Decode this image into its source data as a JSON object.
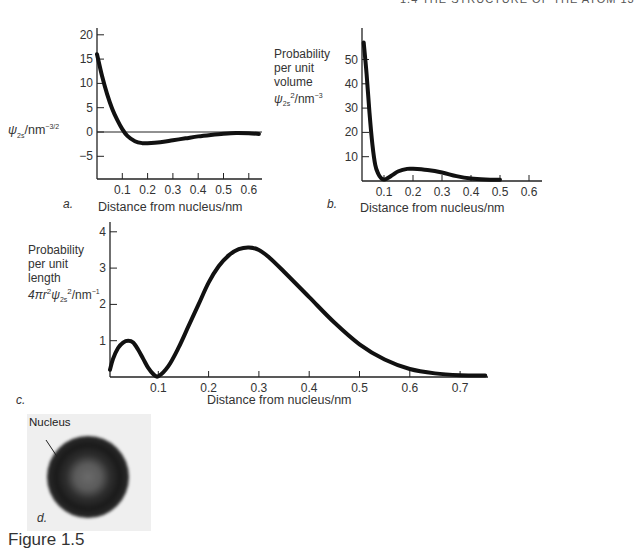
{
  "header": {
    "running_head": "1.4   THE STRUCTURE OF THE ATOM   13"
  },
  "caption": "Figure 1.5",
  "panels": {
    "a": {
      "letter": "a.",
      "ylabel_main": "ψ",
      "ylabel_sub": "2s",
      "ylabel_unit": "/nm",
      "ylabel_exp": "−3/2",
      "xlabel": "Distance from nucleus/nm",
      "yticks": [
        "20",
        "15",
        "10",
        "5",
        "0",
        "−5"
      ],
      "xticks": [
        "0.1",
        "0.2",
        "0.3",
        "0.4",
        "0.5",
        "0.6"
      ]
    },
    "b": {
      "letter": "b.",
      "ylabel_lines": [
        "Probability",
        "per unit",
        "volume"
      ],
      "ylabel_main": "ψ",
      "ylabel_sub": "2s",
      "ylabel_sup": "2",
      "ylabel_unit": "/nm",
      "ylabel_exp": "−3",
      "xlabel": "Distance from nucleus/nm",
      "yticks": [
        "50",
        "40",
        "30",
        "20",
        "10"
      ],
      "xticks": [
        "0.1",
        "0.2",
        "0.3",
        "0.4",
        "0.5",
        "0.6"
      ]
    },
    "c": {
      "letter": "c.",
      "ylabel_lines": [
        "Probability",
        "per unit",
        "length"
      ],
      "ylabel_prefix": "4πr",
      "ylabel_r_sup": "2",
      "ylabel_main": "ψ",
      "ylabel_sub": "2s",
      "ylabel_sup": "2",
      "ylabel_unit": "/nm",
      "ylabel_exp": "−1",
      "xlabel": "Distance from nucleus/nm",
      "yticks": [
        "4",
        "3",
        "2",
        "1"
      ],
      "xticks": [
        "0.1",
        "0.2",
        "0.3",
        "0.4",
        "0.5",
        "0.6",
        "0.7"
      ]
    },
    "d": {
      "letter": "d.",
      "annotation": "Nucleus"
    }
  },
  "chart_data": [
    {
      "id": "a",
      "type": "line",
      "title": "",
      "xlabel": "Distance from nucleus/nm",
      "ylabel": "ψ2s/nm^-3/2",
      "xlim": [
        0,
        0.65
      ],
      "ylim": [
        -9.5,
        22
      ],
      "xticks": [
        0.1,
        0.2,
        0.3,
        0.4,
        0.5,
        0.6
      ],
      "yticks": [
        -5,
        0,
        5,
        10,
        15,
        20
      ],
      "grid": false,
      "zero_line": true,
      "series": [
        {
          "name": "ψ2s",
          "x": [
            0.0,
            0.02,
            0.04,
            0.06,
            0.08,
            0.1,
            0.12,
            0.15,
            0.18,
            0.2,
            0.25,
            0.3,
            0.35,
            0.4,
            0.45,
            0.5,
            0.55,
            0.6,
            0.64
          ],
          "y": [
            16,
            11.5,
            7.8,
            4.8,
            2.5,
            0.6,
            -0.8,
            -1.9,
            -2.3,
            -2.3,
            -2.1,
            -1.7,
            -1.3,
            -0.9,
            -0.6,
            -0.35,
            -0.2,
            -0.25,
            -0.4
          ]
        }
      ]
    },
    {
      "id": "b",
      "type": "line",
      "xlabel": "Distance from nucleus/nm",
      "ylabel": "Probability per unit volume ψ2s²/nm^-3",
      "xlim": [
        0,
        0.65
      ],
      "ylim": [
        0,
        62
      ],
      "xticks": [
        0.1,
        0.2,
        0.3,
        0.4,
        0.5,
        0.6
      ],
      "yticks": [
        10,
        20,
        30,
        40,
        50
      ],
      "grid": false,
      "series": [
        {
          "name": "ψ2s²",
          "x": [
            0.03,
            0.04,
            0.05,
            0.06,
            0.07,
            0.08,
            0.09,
            0.1,
            0.11,
            0.13,
            0.15,
            0.18,
            0.2,
            0.25,
            0.3,
            0.35,
            0.4,
            0.45,
            0.5
          ],
          "y": [
            57,
            44,
            28,
            15,
            6.5,
            3,
            1.2,
            0.6,
            1,
            2.5,
            4,
            5,
            5,
            4.5,
            3.5,
            2,
            1,
            0.6,
            0.5
          ]
        }
      ]
    },
    {
      "id": "c",
      "type": "line",
      "xlabel": "Distance from nucleus/nm",
      "ylabel": "Probability per unit length 4πr²ψ2s²/nm^-1",
      "xlim": [
        0,
        0.75
      ],
      "ylim": [
        0,
        4.3
      ],
      "xticks": [
        0.1,
        0.2,
        0.3,
        0.4,
        0.5,
        0.6,
        0.7
      ],
      "yticks": [
        1,
        2,
        3,
        4
      ],
      "grid": false,
      "series": [
        {
          "name": "4πr²ψ2s²",
          "x": [
            0.0,
            0.01,
            0.02,
            0.03,
            0.04,
            0.05,
            0.06,
            0.07,
            0.08,
            0.09,
            0.1,
            0.12,
            0.14,
            0.16,
            0.18,
            0.2,
            0.22,
            0.24,
            0.26,
            0.28,
            0.3,
            0.32,
            0.35,
            0.4,
            0.45,
            0.5,
            0.55,
            0.6,
            0.65,
            0.7,
            0.75
          ],
          "y": [
            0.2,
            0.5,
            0.8,
            0.95,
            1.0,
            0.95,
            0.75,
            0.5,
            0.25,
            0.08,
            0.02,
            0.3,
            0.8,
            1.4,
            2.0,
            2.6,
            3.05,
            3.35,
            3.52,
            3.57,
            3.5,
            3.3,
            2.9,
            2.2,
            1.5,
            0.9,
            0.48,
            0.22,
            0.1,
            0.05,
            0.04
          ]
        }
      ]
    }
  ]
}
